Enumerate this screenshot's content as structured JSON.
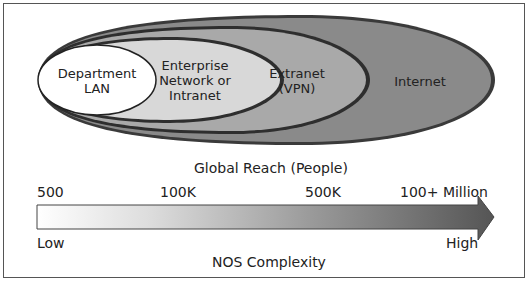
{
  "diagram": {
    "ellipses": [
      {
        "id": "internet",
        "label": "Internet",
        "fill": "#8a8a8a"
      },
      {
        "id": "extranet",
        "label_lines": [
          "Extranet",
          "(VPN)"
        ],
        "fill": "#a9a9a9"
      },
      {
        "id": "enterprise",
        "label_lines": [
          "Enterprise",
          "Network or",
          "Intranet"
        ],
        "fill": "#d8d8d8"
      },
      {
        "id": "department",
        "label_lines": [
          "Department",
          "LAN"
        ],
        "fill": "#ffffff"
      }
    ],
    "axis_title": "Global Reach (People)",
    "scale_ticks": [
      "500",
      "100K",
      "500K",
      "100+ Million"
    ],
    "arrow": {
      "low_label": "Low",
      "high_label": "High",
      "caption": "NOS Complexity",
      "gradient_start": "#ffffff",
      "gradient_end": "#555555"
    }
  }
}
